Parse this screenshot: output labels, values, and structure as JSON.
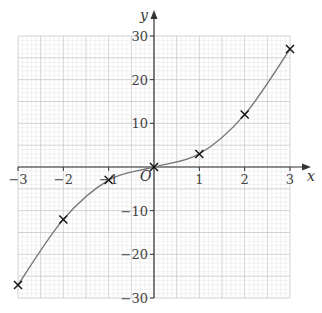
{
  "chart_data": {
    "type": "line",
    "title": "",
    "xlabel": "x",
    "ylabel": "y",
    "origin_label": "O",
    "xlim": [
      -3,
      3
    ],
    "ylim": [
      -30,
      30
    ],
    "grid": true,
    "x_ticks": [
      -3,
      -2,
      -1,
      1,
      2,
      3
    ],
    "x_tick_labels": [
      "−3",
      "−2",
      "−1",
      "1",
      "2",
      "3"
    ],
    "y_ticks": [
      30,
      20,
      10,
      -10,
      -20,
      -30
    ],
    "y_tick_labels": [
      "30",
      "20",
      "10",
      "−10",
      "−20",
      "−30"
    ],
    "series": [
      {
        "name": "curve",
        "style": "smooth line with cross markers",
        "x": [
          -3,
          -2,
          -1,
          0,
          1,
          2,
          3
        ],
        "values": [
          -27,
          -12,
          -3,
          0,
          3,
          12,
          27
        ]
      }
    ]
  },
  "colors": {
    "grid_minor": "#e4e4e4",
    "grid_major": "#c8c8c8",
    "axis": "#333333",
    "curve": "#777777",
    "marker": "#111111"
  }
}
